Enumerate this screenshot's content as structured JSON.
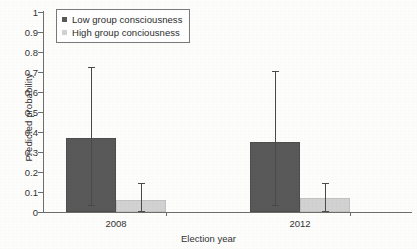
{
  "chart_data": {
    "type": "bar",
    "title": "",
    "subtitle": "",
    "xlabel": "Election year",
    "ylabel": "Predicted probability",
    "categories": [
      "2008",
      "2012"
    ],
    "ylim": [
      0,
      1
    ],
    "yticks": [
      "0",
      "0.1",
      "0.2",
      "0.3",
      "0.4",
      "0.5",
      "0.6",
      "0.7",
      "0.8",
      "0.9",
      "1"
    ],
    "ytick_values": [
      0,
      0.1,
      0.2,
      0.3,
      0.4,
      0.5,
      0.6,
      0.7,
      0.8,
      0.9,
      1
    ],
    "grid": false,
    "legend_position": "top-left",
    "error_bars": "95% confidence interval",
    "series": [
      {
        "name": "Low group consciousness",
        "color": "#595959",
        "values": [
          0.37,
          0.35
        ],
        "error_low": [
          0.03,
          0.03
        ],
        "error_high": [
          0.72,
          0.7
        ]
      },
      {
        "name": "High group conciousness",
        "color": "#d2d2d2",
        "values": [
          0.06,
          0.07
        ],
        "error_low": [
          0.0,
          0.0
        ],
        "error_high": [
          0.14,
          0.14
        ]
      }
    ]
  },
  "legend": {
    "items": [
      {
        "label": "Low group consciousness",
        "color": "#595959"
      },
      {
        "label": "High group conciousness",
        "color": "#d2d2d2"
      }
    ]
  },
  "axes": {
    "y_title": "Predicted probability",
    "x_title": "Election year"
  }
}
